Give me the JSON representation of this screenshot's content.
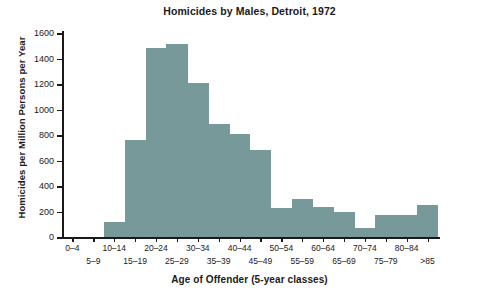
{
  "chart_data": {
    "type": "bar",
    "title": "Homicides by Males, Detroit, 1972",
    "xlabel": "Age of Offender (5-year classes)",
    "ylabel": "Homicides per Million Persons per Year",
    "categories": [
      "0–4",
      "5–9",
      "10–14",
      "15–19",
      "20–24",
      "25–29",
      "30–34",
      "35–39",
      "40–44",
      "45–49",
      "50–54",
      "55–59",
      "60–64",
      "65–69",
      "70–74",
      "75–79",
      "80–84",
      ">85"
    ],
    "values": [
      0,
      0,
      120,
      760,
      1480,
      1510,
      1205,
      885,
      805,
      680,
      230,
      295,
      235,
      195,
      70,
      175,
      175,
      250
    ],
    "ylim": [
      0,
      1600
    ],
    "ytick_values": [
      0,
      200,
      400,
      600,
      800,
      1000,
      1200,
      1400,
      1600
    ],
    "ytick_labels": [
      "0",
      "200",
      "400",
      "600",
      "800",
      "1000",
      "1200",
      "1400",
      "1600"
    ],
    "grid": false,
    "legend": false,
    "bar_color": "#78999a",
    "axis_color": "#1a1a1a",
    "background": "#ffffff",
    "xtick_labels_row_top": [
      "0–4",
      "10–14",
      "20–24",
      "30–34",
      "40–44",
      "50–54",
      "60–64",
      "70–74",
      "80–84"
    ],
    "xtick_labels_row_bottom": [
      "5–9",
      "15–19",
      "25–29",
      "35–39",
      "45–49",
      "55–59",
      "65–69",
      "75–79",
      ">85"
    ]
  }
}
